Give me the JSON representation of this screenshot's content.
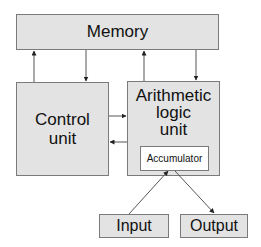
{
  "diagram": {
    "nodes": {
      "memory": {
        "label": "Memory"
      },
      "control_unit": {
        "label_line1": "Control",
        "label_line2": "unit"
      },
      "alu": {
        "label_line1": "Arithmetic",
        "label_line2": "logic",
        "label_line3": "unit"
      },
      "accumulator": {
        "label": "Accumulator"
      },
      "input": {
        "label": "Input"
      },
      "output": {
        "label": "Output"
      }
    },
    "edges": [
      {
        "from": "Control unit",
        "to": "Memory"
      },
      {
        "from": "Memory",
        "to": "Control unit"
      },
      {
        "from": "Arithmetic logic unit",
        "to": "Memory"
      },
      {
        "from": "Memory",
        "to": "Arithmetic logic unit"
      },
      {
        "from": "Control unit",
        "to": "Arithmetic logic unit"
      },
      {
        "from": "Arithmetic logic unit",
        "to": "Control unit"
      },
      {
        "from": "Input",
        "to": "Accumulator"
      },
      {
        "from": "Accumulator",
        "to": "Output"
      }
    ],
    "colors": {
      "box_fill": "#e3e3e3",
      "border": "#7a7a7a",
      "accumulator_fill": "#ffffff"
    }
  }
}
